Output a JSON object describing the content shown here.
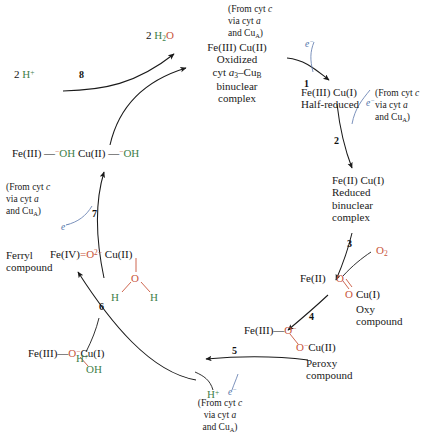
{
  "diagram": {
    "colors": {
      "oxygen_red": "#c8563c",
      "hydrogen_green": "#3f7f4a",
      "electron_blue": "#4a6fa5",
      "text_black": "#141414"
    }
  },
  "species": {
    "water_out": {
      "count": "2",
      "h": "H",
      "h_sub": "2",
      "o": "O"
    },
    "protons_in_left": {
      "count": "2",
      "h": "H",
      "charge": "+"
    },
    "oxidized": {
      "metals": "Fe(III) Cu(II)",
      "line1": "Oxidized",
      "line2_pre": "cyt ",
      "line2_a": "a",
      "line2_sub": "3",
      "line2_dash": "–Cu",
      "line2_b": "B",
      "line3": "binuclear",
      "line4": "complex"
    },
    "half_reduced": {
      "metals": "Fe(III) Cu(I)",
      "label": "Half-reduced"
    },
    "reduced": {
      "metals": "Fe(II) Cu(I)",
      "line1": "Reduced",
      "line2": "binuclear",
      "line3": "complex"
    },
    "oxy": {
      "fe": "Fe(II)",
      "o_top": "O",
      "o_bottom": "O",
      "cu": "Cu(I)",
      "name1": "Oxy",
      "name2": "compound"
    },
    "peroxy": {
      "fe": "Fe(III)",
      "dash": "—",
      "o_top": "O",
      "o_top_charge": "−",
      "o_bottom": "O",
      "o_bottom_charge": "−",
      "cu": "Cu(II)",
      "name1": "Peroxy",
      "name2": "compound"
    },
    "hydroxy_intermediate": {
      "fe": "Fe(III)",
      "dash": "—",
      "o": "O",
      "o_charge": "−",
      "cu": "Cu(I)",
      "oh": "OH"
    },
    "ferryl": {
      "name1": "Ferryl",
      "name2": "compound",
      "fe": "Fe(IV)",
      "eq": "=",
      "o": "O",
      "o_charge": "2−",
      "cu": "Cu(II)",
      "water_o": "O",
      "water_h_left": "H",
      "water_h_right": "H"
    },
    "dihydroxy": {
      "fe": "Fe(III)",
      "dash1": "—",
      "oh1_charge": "−",
      "oh1": "OH",
      "cu": "Cu(II)",
      "dash2": "—",
      "oh2_charge": "−",
      "oh2": "OH"
    },
    "oxygen_molecule": {
      "o": "O",
      "sub": "2"
    }
  },
  "steps": {
    "s1": "1",
    "s2": "2",
    "s3": "3",
    "s4": "4",
    "s5": "5",
    "s6": "6",
    "s7": "7",
    "s8": "8"
  },
  "electrons": {
    "e1": "e",
    "e1_charge": "−",
    "e2": "e",
    "e2_charge": "−",
    "e5": "e",
    "e5_charge": "−",
    "e7": "e",
    "e7_charge": "−"
  },
  "protons": {
    "p6": "H",
    "p6_charge": "+",
    "p5": "H",
    "p5_charge": "+"
  },
  "notes": {
    "source_top_right": {
      "line1_pre": "(From cyt ",
      "line1_it": "c",
      "line2_pre": "via cyt ",
      "line2_it": "a",
      "line3_pre": "and Cu",
      "line3_sub": "A",
      "line3_post": ")"
    },
    "source_right": {
      "line1_pre": "(From cyt ",
      "line1_it": "c",
      "line2_pre": "via cyt ",
      "line2_it": "a",
      "line3_pre": "and Cu",
      "line3_sub": "A",
      "line3_post": ")"
    },
    "source_left": {
      "line1_pre": "(From cyt ",
      "line1_it": "c",
      "line2_pre": "via cyt ",
      "line2_it": "a",
      "line3_pre": "and Cu",
      "line3_sub": "A",
      "line3_post": ")"
    },
    "source_bottom": {
      "line1_pre": "(From cyt ",
      "line1_it": "c",
      "line2_pre": "via cyt ",
      "line2_it": "a",
      "line3_pre": "and Cu",
      "line3_sub": "A",
      "line3_post": ")"
    }
  }
}
